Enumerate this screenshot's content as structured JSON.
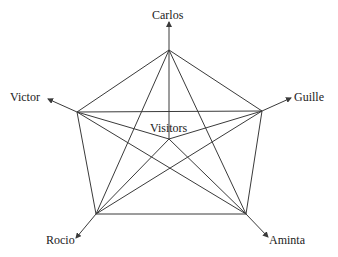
{
  "diagram": {
    "type": "network-graph",
    "center": {
      "id": "visitors",
      "label": "Visitors",
      "x": 169,
      "y": 139,
      "label_x": 150,
      "label_y": 132
    },
    "nodes": [
      {
        "id": "carlos",
        "label": "Carlos",
        "x": 169,
        "y": 50,
        "arrow_to": [
          169,
          22
        ],
        "label_x": 152,
        "label_y": 19,
        "anchor": "start"
      },
      {
        "id": "guille",
        "label": "Guille",
        "x": 262,
        "y": 111,
        "arrow_to": [
          291,
          98
        ],
        "label_x": 294,
        "label_y": 101,
        "anchor": "start"
      },
      {
        "id": "aminta",
        "label": "Aminta",
        "x": 246,
        "y": 214,
        "arrow_to": [
          268,
          237
        ],
        "label_x": 269,
        "label_y": 244,
        "anchor": "start"
      },
      {
        "id": "rocio",
        "label": "Rocio",
        "x": 96,
        "y": 214,
        "arrow_to": [
          76,
          238
        ],
        "label_x": 46,
        "label_y": 244,
        "anchor": "start"
      },
      {
        "id": "victor",
        "label": "Victor",
        "x": 77,
        "y": 112,
        "arrow_to": [
          48,
          99
        ],
        "label_x": 10,
        "label_y": 101,
        "anchor": "start"
      }
    ],
    "edges": [
      [
        "carlos",
        "guille"
      ],
      [
        "carlos",
        "aminta"
      ],
      [
        "carlos",
        "rocio"
      ],
      [
        "carlos",
        "victor"
      ],
      [
        "carlos",
        "visitors"
      ],
      [
        "guille",
        "aminta"
      ],
      [
        "guille",
        "rocio"
      ],
      [
        "guille",
        "victor"
      ],
      [
        "guille",
        "visitors"
      ],
      [
        "aminta",
        "rocio"
      ],
      [
        "aminta",
        "victor"
      ],
      [
        "aminta",
        "visitors"
      ],
      [
        "rocio",
        "victor"
      ],
      [
        "rocio",
        "visitors"
      ],
      [
        "victor",
        "visitors"
      ]
    ],
    "colors": {
      "line": "#3a3a3a",
      "text": "#222222",
      "background": "#ffffff"
    }
  }
}
